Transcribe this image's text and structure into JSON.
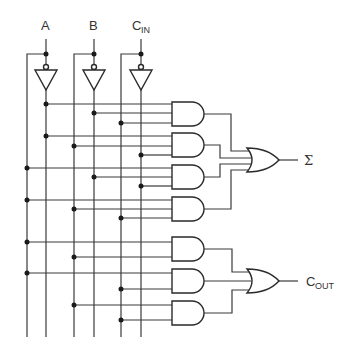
{
  "diagram": {
    "inputs": [
      {
        "name": "A",
        "label": "A",
        "sub": ""
      },
      {
        "name": "B",
        "label": "B",
        "sub": ""
      },
      {
        "name": "CIN",
        "label": "C",
        "sub": "IN"
      }
    ],
    "outputs": [
      {
        "name": "SUM",
        "label": "Σ",
        "sub": ""
      },
      {
        "name": "COUT",
        "label": "C",
        "sub": "OUT"
      }
    ],
    "gates": {
      "inverters": [
        "NOT A",
        "NOT B",
        "NOT CIN"
      ],
      "and_gates": [
        [
          "A'",
          "B'",
          "CIN"
        ],
        [
          "A'",
          "B",
          "CIN'"
        ],
        [
          "A",
          "B'",
          "CIN'"
        ],
        [
          "A",
          "B",
          "CIN"
        ],
        [
          "A",
          "B"
        ],
        [
          "A",
          "CIN"
        ],
        [
          "B",
          "CIN"
        ]
      ],
      "or_gates": [
        {
          "inputs": [
            "AND1",
            "AND2",
            "AND3",
            "AND4"
          ],
          "output": "Σ"
        },
        {
          "inputs": [
            "AND5",
            "AND6",
            "AND7"
          ],
          "output": "COUT"
        }
      ]
    },
    "colors": {
      "line": "#3a3a3a",
      "background": "#ffffff"
    }
  }
}
